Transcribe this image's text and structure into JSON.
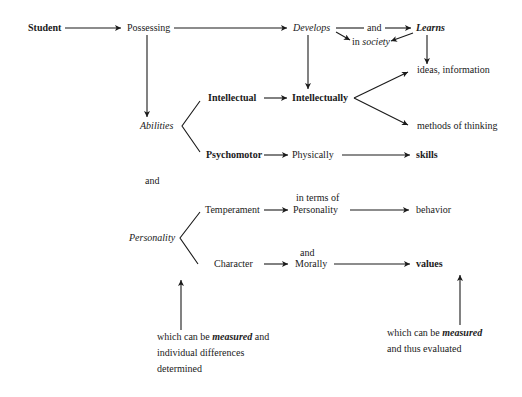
{
  "diagram": {
    "nodes": {
      "student": "Student",
      "possessing": "Possessing",
      "develops": "Develops",
      "and_top": "and",
      "learns": "Learns",
      "in_society_prefix": "in ",
      "in_society_word": "society",
      "abilities": "Abilities",
      "intellectual": "Intellectual",
      "intellectually": "Intellectually",
      "ideas_information": "ideas, information",
      "methods_of_thinking": "methods of thinking",
      "psychomotor": "Psychomotor",
      "physically": "Physically",
      "skills": "skills",
      "and_middle": "and",
      "personality": "Personality",
      "temperament": "Temperament",
      "in_terms_of": "in terms of",
      "personality_term": "Personality",
      "behavior": "behavior",
      "character": "Character",
      "and_morally_top": "and",
      "morally": "Morally",
      "values": "values"
    },
    "notes": {
      "left": {
        "line1_prefix": "which can be ",
        "line1_emph": "measured",
        "line1_suffix": " and",
        "line2": "individual differences",
        "line3": "determined"
      },
      "right": {
        "line1_prefix": "which can be ",
        "line1_emph": "measured",
        "line2": "and thus evaluated"
      }
    },
    "edges": [
      {
        "from": "Student",
        "to": "Possessing"
      },
      {
        "from": "Possessing",
        "to": "Develops"
      },
      {
        "from": "Possessing",
        "to": "Abilities"
      },
      {
        "from": "Develops",
        "to": "and"
      },
      {
        "from": "and",
        "to": "Learns"
      },
      {
        "from": "Develops",
        "to": "in society"
      },
      {
        "from": "Learns",
        "to": "in society"
      },
      {
        "from": "Learns",
        "to": "ideas, information"
      },
      {
        "from": "Develops",
        "to": "Intellectually"
      },
      {
        "from": "Abilities",
        "to": "Intellectual"
      },
      {
        "from": "Abilities",
        "to": "Psychomotor"
      },
      {
        "from": "Intellectual",
        "to": "Intellectually"
      },
      {
        "from": "Intellectually",
        "to": "ideas, information"
      },
      {
        "from": "Intellectually",
        "to": "methods of thinking"
      },
      {
        "from": "Psychomotor",
        "to": "Physically"
      },
      {
        "from": "Physically",
        "to": "skills"
      },
      {
        "from": "Personality",
        "to": "Temperament"
      },
      {
        "from": "Personality",
        "to": "Character"
      },
      {
        "from": "Temperament",
        "to": "in terms of Personality"
      },
      {
        "from": "in terms of Personality",
        "to": "behavior"
      },
      {
        "from": "Character",
        "to": "and Morally"
      },
      {
        "from": "and Morally",
        "to": "values"
      },
      {
        "from": "left note",
        "to": "Personality"
      },
      {
        "from": "right note",
        "to": "values"
      }
    ]
  }
}
